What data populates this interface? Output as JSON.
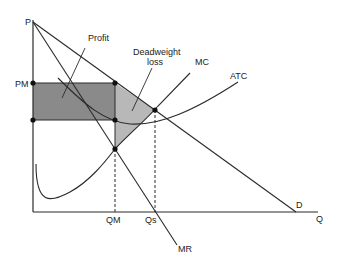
{
  "diagram": {
    "axes": {
      "y_label": "P",
      "x_label": "Q"
    },
    "price_labels": {
      "monopoly_price": "PM"
    },
    "quantity_labels": {
      "monopoly_quantity": "QM",
      "socially_optimal_quantity": "Qs"
    },
    "curves": {
      "demand": "D",
      "marginal_revenue": "MR",
      "marginal_cost": "MC",
      "average_total_cost": "ATC"
    },
    "regions": {
      "profit": "Profit",
      "deadweight_loss_line1": "Deadweight",
      "deadweight_loss_line2": "loss"
    },
    "colors": {
      "profit_fill": "#8a8a8a",
      "dwl_fill": "#b8b8b8",
      "line": "#2a2a2a"
    }
  }
}
